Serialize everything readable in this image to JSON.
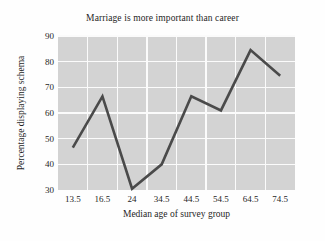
{
  "chart_data": {
    "type": "line",
    "title": "Marriage is more important than career",
    "xlabel": "Median age of survey group",
    "ylabel": "Percentage displaying schema",
    "categories": [
      "13.5",
      "16.5",
      "24",
      "34.5",
      "44.5",
      "54.5",
      "64.5",
      "74.5"
    ],
    "x_tick_labels": [
      "13.5",
      "16.5",
      "24",
      "34.5",
      "44.5",
      "54.5",
      "64.5",
      "74.5"
    ],
    "y_tick_labels": [
      "30",
      "40",
      "50",
      "60",
      "70",
      "80",
      "90"
    ],
    "y_ticks": [
      30,
      40,
      50,
      60,
      70,
      80,
      90
    ],
    "values": [
      46.5,
      66.5,
      30.5,
      40.0,
      66.5,
      61.0,
      84.5,
      74.5
    ],
    "ylim": [
      30,
      90
    ],
    "grid": true,
    "legend": "none",
    "series": [
      {
        "name": "Percentage displaying schema",
        "values": [
          46.5,
          66.5,
          30.5,
          40.0,
          66.5,
          61.0,
          84.5,
          74.5
        ]
      }
    ],
    "colors": {
      "plot_background": "#d3d3d3",
      "gridline": "#fbfbfb",
      "line": "#4a4a4a",
      "figure_background": "#fefefe",
      "text": "#1f1f1f"
    },
    "line_width": 2.6
  }
}
